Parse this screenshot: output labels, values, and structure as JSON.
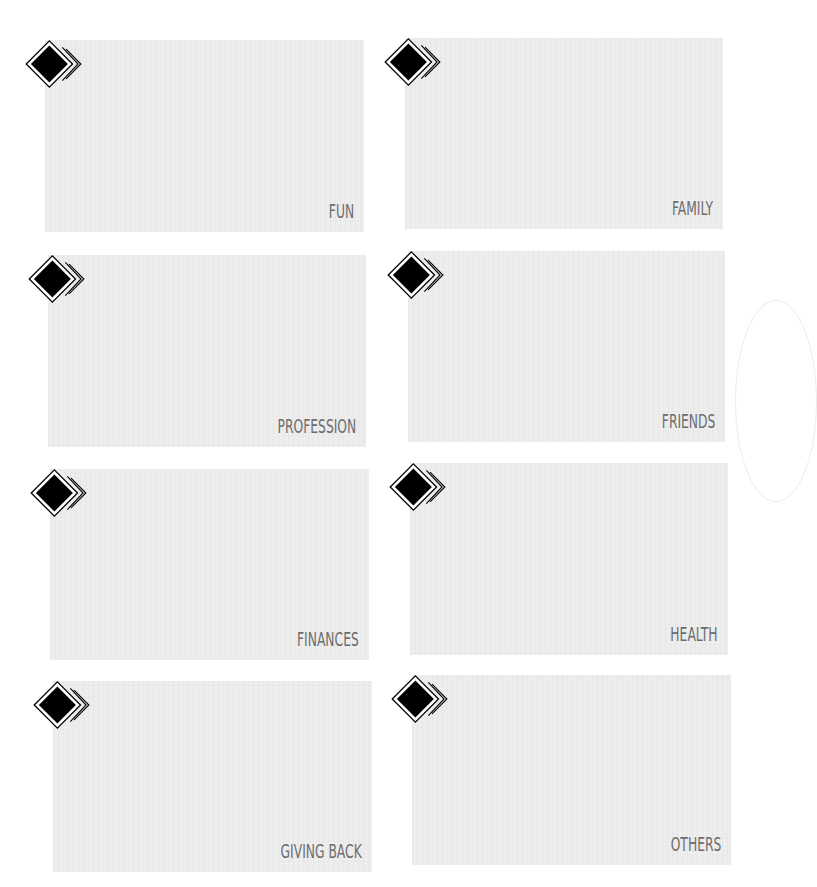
{
  "cards": [
    {
      "label": "FUN",
      "icon": "diamond-icon"
    },
    {
      "label": "FAMILY",
      "icon": "diamond-icon"
    },
    {
      "label": "PROFESSION",
      "icon": "diamond-icon"
    },
    {
      "label": "FRIENDS",
      "icon": "diamond-icon"
    },
    {
      "label": "FINANCES",
      "icon": "diamond-icon"
    },
    {
      "label": "HEALTH",
      "icon": "diamond-icon"
    },
    {
      "label": "GIVING BACK",
      "icon": "diamond-icon"
    },
    {
      "label": "OTHERS",
      "icon": "diamond-icon"
    }
  ],
  "colors": {
    "card": "#ececec",
    "label": "#6d6d6d",
    "diamond": "#000000"
  }
}
